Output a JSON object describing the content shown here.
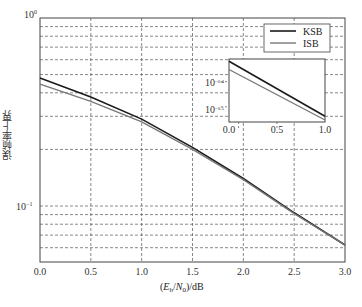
{
  "chart_data": {
    "type": "line",
    "title": "",
    "xlabel": "(E_b/N_0)/dB",
    "ylabel": "误帧率上界",
    "yscale": "log",
    "xlim": [
      0.0,
      3.0
    ],
    "ylim": [
      0.05,
      1.0
    ],
    "grid": true,
    "legend_position": "upper right",
    "x_ticks": [
      "0.0",
      "0.5",
      "1.0",
      "1.5",
      "2.0",
      "2.5",
      "3.0"
    ],
    "y_ticks": [
      "10^0",
      "10^-1"
    ],
    "x": [
      0.0,
      0.5,
      1.0,
      1.5,
      2.0,
      2.5,
      3.0
    ],
    "series": [
      {
        "name": "KSB",
        "color": "#1a1a1a",
        "values": [
          0.48,
          0.38,
          0.29,
          0.205,
          0.14,
          0.092,
          0.062
        ]
      },
      {
        "name": "ISB",
        "color": "#777777",
        "values": [
          0.445,
          0.36,
          0.28,
          0.2,
          0.138,
          0.091,
          0.062
        ]
      }
    ],
    "inset": {
      "xlim": [
        0.0,
        1.0
      ],
      "x_ticks": [
        "0.0",
        "0.5",
        "1.0"
      ],
      "y_ticks": [
        "10^-0.4",
        "10^-0.5"
      ],
      "x": [
        0.0,
        1.0
      ],
      "series": [
        {
          "name": "KSB",
          "values": [
            0.48,
            0.29
          ]
        },
        {
          "name": "ISB",
          "values": [
            0.445,
            0.28
          ]
        }
      ]
    }
  },
  "labels": {
    "ylabel": "误帧率上界",
    "xlabel_parts": [
      "(",
      "E",
      "b",
      "/",
      "N",
      "0",
      ")/dB"
    ],
    "y_top_base": "10",
    "y_top_exp": "0",
    "y_mid_base": "10",
    "y_mid_exp": "−1",
    "inset_y1_base": "10",
    "inset_y1_exp": "−0.4",
    "inset_y2_base": "10",
    "inset_y2_exp": "−0.5",
    "legend": [
      "KSB",
      "ISB"
    ]
  }
}
